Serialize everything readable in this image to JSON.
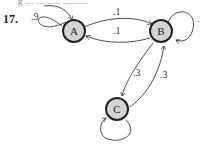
{
  "cut_text": "g  ....  ...........  ...........",
  "problem_number": "17.",
  "nodes": [
    {
      "id": "A",
      "label": "A"
    },
    {
      "id": "B",
      "label": "B"
    },
    {
      "id": "C",
      "label": "C"
    }
  ],
  "edges": [
    {
      "from": "A",
      "to": "A",
      "label": ".9"
    },
    {
      "from": "A",
      "to": "B",
      "label": ".1"
    },
    {
      "from": "B",
      "to": "A",
      "label": ".1"
    },
    {
      "from": "B",
      "to": "C",
      "label": ".3"
    },
    {
      "from": "C",
      "to": "B",
      "label": ".3"
    },
    {
      "from": "B",
      "to": "B",
      "label": "."
    },
    {
      "from": "C",
      "to": "C",
      "label": ""
    }
  ],
  "colors": {
    "node_fill": "#d4d4d4",
    "stroke": "#222222"
  }
}
